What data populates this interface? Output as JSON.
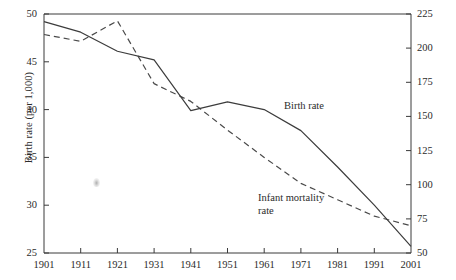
{
  "chart_data": {
    "type": "line",
    "title": "",
    "xlabel": "",
    "ylabel": "Birth rate (per 1,000)",
    "y2label": "Infant mortality rate (per 1,000 live births)",
    "x": [
      1901,
      1911,
      1921,
      1931,
      1941,
      1951,
      1961,
      1971,
      1981,
      1991,
      2001
    ],
    "xlim": [
      1901,
      2001
    ],
    "ylim": [
      25,
      50
    ],
    "y2lim": [
      50,
      225
    ],
    "grid": false,
    "legend_position": "inline-annotations",
    "xticks": [
      1901,
      1911,
      1921,
      1931,
      1941,
      1951,
      1961,
      1971,
      1981,
      1991,
      2001
    ],
    "xtick_labels": [
      "1901",
      "1911",
      "1921",
      "1931",
      "1941",
      "1951",
      "1961",
      "1971",
      "1981",
      "1991",
      "2001"
    ],
    "yticks": [
      25,
      30,
      35,
      40,
      45,
      50
    ],
    "ytick_labels": [
      "25",
      "30",
      "35",
      "40",
      "45",
      "50"
    ],
    "y2ticks": [
      50,
      75,
      100,
      125,
      150,
      175,
      200,
      225
    ],
    "y2tick_labels": [
      "50",
      "75",
      "100",
      "125",
      "150",
      "175",
      "200",
      "225"
    ],
    "series": [
      {
        "name": "Birth rate",
        "axis": "left",
        "style": "solid",
        "color": "#3c3c3c",
        "values": [
          49.2,
          48.1,
          46.1,
          45.2,
          39.9,
          40.8,
          40.0,
          37.8,
          34.0,
          30.0,
          25.7
        ]
      },
      {
        "name": "Infant mortality rate",
        "axis": "right",
        "style": "dashed",
        "color": "#4a4a4a",
        "values": [
          210.0,
          205.0,
          220.0,
          174.0,
          161.0,
          140.0,
          120.0,
          101.0,
          89.0,
          77.0,
          70.0
        ]
      }
    ],
    "annotations": [
      {
        "text": "Birth rate",
        "x": 1961,
        "y": 40.0
      },
      {
        "text": "Infant mortality\nrate",
        "x": 1971,
        "y": 30.5
      }
    ]
  },
  "labels": {
    "y_axis_title": "Birth rate (per 1,000)",
    "y2_axis_title": "Infant mortality rate (per 1,000 live births)",
    "series_birth_rate": "Birth rate",
    "series_infant_mortality_line1": "Infant mortality",
    "series_infant_mortality_line2": "rate"
  },
  "colors": {
    "axis": "#3a3a3a",
    "text": "#2b2b2b",
    "birth_rate": "#3c3c3c",
    "infant_mortality": "#4a4a4a",
    "background": "#ffffff"
  }
}
